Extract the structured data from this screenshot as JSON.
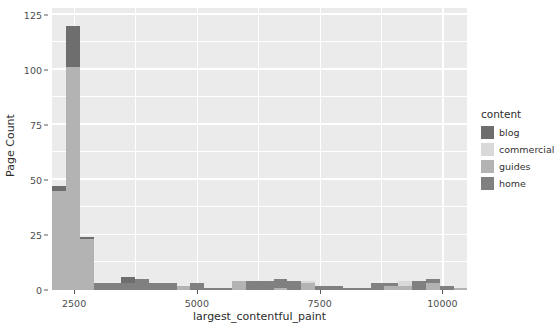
{
  "chart_data": {
    "type": "bar",
    "title": "",
    "xlabel": "largest_contentful_paint",
    "ylabel": "Page Count",
    "xlim": [
      2050,
      10500
    ],
    "ylim": [
      0,
      128
    ],
    "grid": true,
    "stacked": true,
    "legend_position": "right",
    "legend_title": "content",
    "x_ticks": [
      2500,
      5000,
      7500,
      10000
    ],
    "y_ticks": [
      0,
      25,
      50,
      75,
      100,
      125
    ],
    "bin_width": 282,
    "categories": [
      "2050-2332",
      "2332-2614",
      "2614-2896",
      "2896-3178",
      "3178-3460",
      "3460-3742",
      "3742-4024",
      "4024-4306",
      "4306-4588",
      "4588-4870",
      "4870-5152",
      "5152-5434",
      "5434-5716",
      "5716-5998",
      "5998-6280",
      "6280-6562",
      "6562-6844",
      "6844-7126",
      "7126-7408",
      "7408-7690",
      "7690-7972",
      "7972-8254",
      "8254-8536",
      "8536-8818",
      "8818-9100",
      "9100-9382",
      "9382-9664",
      "9664-9946",
      "9946-10228",
      "10228-10510"
    ],
    "series": [
      {
        "name": "blog",
        "color": "#6e6e6e",
        "values": [
          2,
          19,
          1,
          0,
          0,
          3,
          0,
          0,
          0,
          0,
          0,
          0,
          0,
          0,
          0,
          0,
          0,
          0,
          0,
          0,
          0,
          0,
          0,
          0,
          0,
          0,
          0,
          0,
          0,
          0
        ]
      },
      {
        "name": "commercial",
        "color": "#d9d9d9",
        "values": [
          0,
          0,
          0,
          0,
          0,
          0,
          0,
          0,
          0,
          0,
          0,
          0,
          0,
          0,
          0,
          0,
          0,
          0,
          1,
          0,
          0,
          0,
          0,
          0,
          0,
          2,
          0,
          0,
          0,
          0
        ]
      },
      {
        "name": "guides",
        "color": "#b3b3b3",
        "values": [
          45,
          101,
          23,
          0,
          0,
          0,
          0,
          0,
          0,
          2,
          0,
          0,
          0,
          4,
          0,
          0,
          1,
          0,
          3,
          0,
          0,
          0,
          0,
          0,
          2,
          2,
          0,
          3,
          0,
          1
        ]
      },
      {
        "name": "home",
        "color": "#808080",
        "values": [
          0,
          0,
          0,
          3,
          3,
          3,
          5,
          3,
          3,
          0,
          3,
          1,
          1,
          0,
          4,
          4,
          4,
          4,
          1,
          2,
          2,
          1,
          1,
          3,
          1,
          1,
          4,
          2,
          2,
          0
        ]
      }
    ],
    "bars": [
      {
        "x0": 2050,
        "x1": 2332,
        "segments": [
          {
            "name": "guides",
            "value": 45
          },
          {
            "name": "blog",
            "value": 2
          }
        ]
      },
      {
        "x0": 2332,
        "x1": 2614,
        "segments": [
          {
            "name": "guides",
            "value": 101
          },
          {
            "name": "blog",
            "value": 19
          }
        ]
      },
      {
        "x0": 2614,
        "x1": 2896,
        "segments": [
          {
            "name": "guides",
            "value": 23
          },
          {
            "name": "blog",
            "value": 1
          }
        ]
      },
      {
        "x0": 2896,
        "x1": 3178,
        "segments": [
          {
            "name": "home",
            "value": 3
          }
        ]
      },
      {
        "x0": 3178,
        "x1": 3460,
        "segments": [
          {
            "name": "home",
            "value": 3
          }
        ]
      },
      {
        "x0": 3460,
        "x1": 3742,
        "segments": [
          {
            "name": "home",
            "value": 3
          },
          {
            "name": "blog",
            "value": 3
          }
        ]
      },
      {
        "x0": 3742,
        "x1": 4024,
        "segments": [
          {
            "name": "home",
            "value": 5
          }
        ]
      },
      {
        "x0": 4024,
        "x1": 4306,
        "segments": [
          {
            "name": "home",
            "value": 3
          }
        ]
      },
      {
        "x0": 4306,
        "x1": 4588,
        "segments": [
          {
            "name": "home",
            "value": 3
          }
        ]
      },
      {
        "x0": 4588,
        "x1": 4870,
        "segments": [
          {
            "name": "guides",
            "value": 2
          }
        ]
      },
      {
        "x0": 4870,
        "x1": 5152,
        "segments": [
          {
            "name": "home",
            "value": 3
          }
        ]
      },
      {
        "x0": 5152,
        "x1": 5434,
        "segments": [
          {
            "name": "home",
            "value": 1
          }
        ]
      },
      {
        "x0": 5434,
        "x1": 5716,
        "segments": [
          {
            "name": "home",
            "value": 1
          }
        ]
      },
      {
        "x0": 5716,
        "x1": 5998,
        "segments": [
          {
            "name": "guides",
            "value": 4
          }
        ]
      },
      {
        "x0": 5998,
        "x1": 6280,
        "segments": [
          {
            "name": "home",
            "value": 4
          }
        ]
      },
      {
        "x0": 6280,
        "x1": 6562,
        "segments": [
          {
            "name": "home",
            "value": 4
          }
        ]
      },
      {
        "x0": 6562,
        "x1": 6844,
        "segments": [
          {
            "name": "guides",
            "value": 1
          },
          {
            "name": "home",
            "value": 4
          }
        ]
      },
      {
        "x0": 6844,
        "x1": 7126,
        "segments": [
          {
            "name": "home",
            "value": 4
          }
        ]
      },
      {
        "x0": 7126,
        "x1": 7408,
        "segments": [
          {
            "name": "guides",
            "value": 3
          },
          {
            "name": "commercial",
            "value": 1
          }
        ]
      },
      {
        "x0": 7408,
        "x1": 7690,
        "segments": [
          {
            "name": "home",
            "value": 2
          }
        ]
      },
      {
        "x0": 7690,
        "x1": 7972,
        "segments": [
          {
            "name": "home",
            "value": 2
          }
        ]
      },
      {
        "x0": 7972,
        "x1": 8254,
        "segments": [
          {
            "name": "home",
            "value": 1
          }
        ]
      },
      {
        "x0": 8254,
        "x1": 8536,
        "segments": [
          {
            "name": "home",
            "value": 1
          }
        ]
      },
      {
        "x0": 8536,
        "x1": 8818,
        "segments": [
          {
            "name": "home",
            "value": 3
          }
        ]
      },
      {
        "x0": 8818,
        "x1": 9100,
        "segments": [
          {
            "name": "guides",
            "value": 2
          },
          {
            "name": "home",
            "value": 1
          }
        ]
      },
      {
        "x0": 9100,
        "x1": 9382,
        "segments": [
          {
            "name": "guides",
            "value": 2
          },
          {
            "name": "commercial",
            "value": 2
          }
        ]
      },
      {
        "x0": 9382,
        "x1": 9664,
        "segments": [
          {
            "name": "home",
            "value": 4
          }
        ]
      },
      {
        "x0": 9664,
        "x1": 9946,
        "segments": [
          {
            "name": "guides",
            "value": 3
          },
          {
            "name": "home",
            "value": 2
          }
        ]
      },
      {
        "x0": 9946,
        "x1": 10228,
        "segments": [
          {
            "name": "home",
            "value": 2
          }
        ]
      },
      {
        "x0": 10228,
        "x1": 10510,
        "segments": [
          {
            "name": "guides",
            "value": 1
          }
        ]
      }
    ]
  },
  "legend": {
    "title": "content",
    "items": [
      {
        "label": "blog",
        "color": "#6e6e6e"
      },
      {
        "label": "commercial",
        "color": "#d9d9d9"
      },
      {
        "label": "guides",
        "color": "#b3b3b3"
      },
      {
        "label": "home",
        "color": "#808080"
      }
    ]
  },
  "axes": {
    "y_title": "Page Count",
    "x_title": "largest_contentful_paint",
    "y_tick_labels": [
      "0",
      "25",
      "50",
      "75",
      "100",
      "125"
    ],
    "x_tick_labels": [
      "2500",
      "5000",
      "7500",
      "10000"
    ]
  },
  "theme": {
    "panel_background": "#ebebeb",
    "gridline_color": "#ffffff",
    "page_background": "#ffffff",
    "text_color": "#2b2b2b",
    "tick_color": "#4d4d4d"
  }
}
